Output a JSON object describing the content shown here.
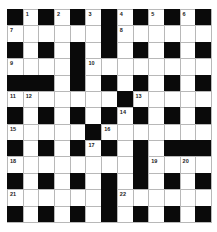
{
  "puzzle": {
    "rows": 13,
    "cols": 13,
    "colors": {
      "block": "#0a0a0a",
      "cell": "#ffffff",
      "gridline": "#b8b8b8"
    },
    "layout": [
      "#.#.#.#.#.#.#",
      "......#......",
      "#.#.#.#.#.#.#",
      "....#........",
      "###.#.#.#.#.#",
      ".......#.....",
      "#.#.#.#.#.#.#",
      ".....#.......",
      "#.#.#.#.#.###",
      "........#....",
      "#.#.#.#.#.#.#",
      "......#......",
      "#.#.#.#.#.#.#"
    ],
    "numbers": [
      {
        "row": 0,
        "col": 1,
        "n": "1"
      },
      {
        "row": 0,
        "col": 3,
        "n": "2"
      },
      {
        "row": 0,
        "col": 5,
        "n": "3"
      },
      {
        "row": 0,
        "col": 7,
        "n": "4"
      },
      {
        "row": 0,
        "col": 9,
        "n": "5"
      },
      {
        "row": 0,
        "col": 11,
        "n": "6"
      },
      {
        "row": 1,
        "col": 0,
        "n": "7"
      },
      {
        "row": 1,
        "col": 7,
        "n": "8"
      },
      {
        "row": 3,
        "col": 0,
        "n": "9"
      },
      {
        "row": 3,
        "col": 5,
        "n": "10"
      },
      {
        "row": 5,
        "col": 0,
        "n": "11"
      },
      {
        "row": 5,
        "col": 1,
        "n": "12"
      },
      {
        "row": 5,
        "col": 8,
        "n": "13"
      },
      {
        "row": 6,
        "col": 7,
        "n": "14"
      },
      {
        "row": 7,
        "col": 0,
        "n": "15"
      },
      {
        "row": 7,
        "col": 6,
        "n": "16"
      },
      {
        "row": 8,
        "col": 5,
        "n": "17"
      },
      {
        "row": 9,
        "col": 0,
        "n": "18"
      },
      {
        "row": 9,
        "col": 9,
        "n": "19"
      },
      {
        "row": 9,
        "col": 11,
        "n": "20"
      },
      {
        "row": 11,
        "col": 0,
        "n": "21"
      },
      {
        "row": 11,
        "col": 7,
        "n": "22"
      }
    ]
  }
}
